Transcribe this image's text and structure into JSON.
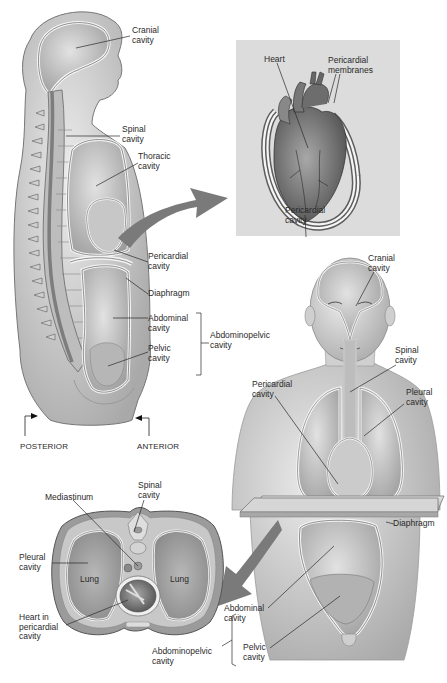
{
  "figure": {
    "colors": {
      "background": "#ffffff",
      "inset_background": "#dcdcdc",
      "arrow": "#7a7a7a",
      "skin": "#d9d9d9",
      "skin_shadow": "#a8a8a8",
      "cavity": "#c4c4c4",
      "membrane": "#f4f4f4",
      "outline": "#555555",
      "leader_line": "#2a2a2a",
      "text": "#2a2a2a"
    }
  },
  "sagittal_view": {
    "labels": {
      "cranial_cavity": "Cranial\ncavity",
      "spinal_cavity": "Spinal\ncavity",
      "thoracic_cavity": "Thoracic\ncavity",
      "pericardial_cavity": "Pericardial\ncavity",
      "diaphragm": "Diaphragm",
      "abdominal_cavity": "Abdominal\ncavity",
      "pelvic_cavity": "Pelvic\ncavity",
      "abdominopelvic_cavity": "Abdominopelvic\ncavity",
      "posterior": "POSTERIOR",
      "anterior": "ANTERIOR"
    }
  },
  "heart_inset": {
    "labels": {
      "heart": "Heart",
      "pericardial_membranes": "Pericardial\nmembranes",
      "pericardial_cavity": "Pericardial\ncavity"
    }
  },
  "frontal_view": {
    "labels": {
      "cranial_cavity": "Cranial\ncavity",
      "spinal_cavity": "Spinal\ncavity",
      "pericardial_cavity": "Pericardial\ncavity",
      "pleural_cavity": "Pleural\ncavity",
      "diaphragm": "Diaphragm",
      "abdominal_cavity": "Abdominal\ncavity",
      "pelvic_cavity": "Pelvic\ncavity",
      "abdominopelvic_cavity": "Abdominopelvic\ncavity"
    }
  },
  "cross_section": {
    "labels": {
      "mediastinum": "Mediastinum",
      "spinal_cavity": "Spinal\ncavity",
      "pleural_cavity": "Pleural\ncavity",
      "lung_left": "Lung",
      "lung_right": "Lung",
      "heart_in_pericardial_cavity": "Heart in\npericardial\ncavity"
    }
  }
}
